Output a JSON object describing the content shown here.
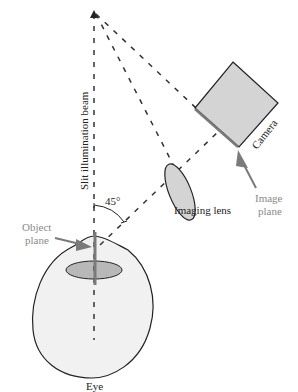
{
  "diagram": {
    "labels": {
      "beam": "Slit illumination beam",
      "angle": "45°",
      "object_plane_line1": "Object",
      "object_plane_line2": "plane",
      "imaging_lens": "Imaging lens",
      "camera": "Camera",
      "image_plane_line1": "Image",
      "image_plane_line2": "plane",
      "eye": "Eye"
    },
    "colors": {
      "outline": "#222222",
      "fill_light": "#f1f1f1",
      "fill_mid": "#d4d4d4",
      "fill_dark": "#b3b3b3",
      "arrow_gray": "#7a7a7a",
      "dash": "#333333"
    },
    "components": [
      "eye",
      "object-plane",
      "slit-illumination-beam",
      "imaging-lens",
      "camera",
      "image-plane"
    ]
  }
}
